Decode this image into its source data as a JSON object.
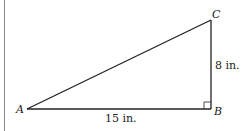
{
  "diagram": {
    "type": "right-triangle",
    "vertices": {
      "A": {
        "label": "A"
      },
      "B": {
        "label": "B"
      },
      "C": {
        "label": "C"
      }
    },
    "sides": {
      "AB": {
        "label": "15 in."
      },
      "BC": {
        "label": "8 in."
      }
    },
    "right_angle_at": "B",
    "colors": {
      "stroke": "#222222",
      "margin_rule": "#888888"
    }
  }
}
